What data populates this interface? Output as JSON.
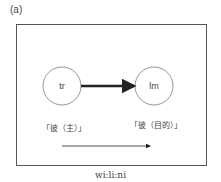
{
  "figure": {
    "panel_label": "(a)",
    "caption": "wi:li:ni",
    "nodes": [
      {
        "id": "tr",
        "label": "tr",
        "sublabel": "「彼（主）」"
      },
      {
        "id": "lm",
        "label": "lm",
        "sublabel": "「彼（目的）」"
      }
    ],
    "edges": [
      {
        "from": "tr",
        "to": "lm",
        "style": "thick-arrow"
      }
    ],
    "direction_arrow": "thin-arrow-right"
  }
}
